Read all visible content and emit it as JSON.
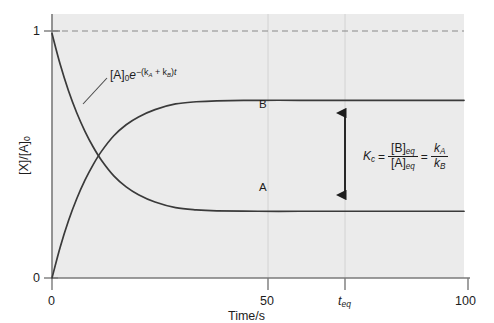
{
  "figure": {
    "title": "",
    "plot_bg_color": "#ebebeb",
    "axis_color": "#6e6e6e",
    "curve_color": "#3a3a3a",
    "text_color": "#1d1d1d"
  },
  "axes": {
    "y": {
      "label": "[X]/[A]",
      "label_sub": "0",
      "ticks": [
        {
          "value": 0,
          "text": "0"
        },
        {
          "value": 1,
          "text": "1"
        }
      ],
      "range": [
        0,
        1.08
      ]
    },
    "x": {
      "label": "Time/s",
      "ticks": [
        {
          "value": 0,
          "text": "0",
          "italic": false
        },
        {
          "value": 50,
          "text": "50",
          "italic": false
        },
        {
          "value": 72,
          "text": "t",
          "sub": "eq",
          "italic": true
        },
        {
          "value": 100,
          "text": "100",
          "italic": false
        }
      ],
      "range": [
        0,
        100
      ]
    }
  },
  "annotations": {
    "curve_a_tag": "A",
    "curve_b_tag": "B",
    "decay_formula": {
      "bracket": "[A]",
      "bracket_sub": "0",
      "base": "e",
      "exponent": "−(k",
      "exp_sub_a": "A",
      "exp_mid": " + k",
      "exp_sub_b": "B",
      "exp_close": ")",
      "exp_t": "t"
    },
    "equilibrium_constant": {
      "symbol": "K",
      "symbol_sub": "c",
      "equals": "=",
      "numerator": "[B]",
      "numerator_sub": "eq",
      "denominator": "[A]",
      "denominator_sub": "eq",
      "equals2": "=",
      "numerator2": "k",
      "numerator2_sub": "A",
      "denominator2": "k",
      "denominator2_sub": "B"
    },
    "dashed_line_value": 1,
    "arrow_label": "equilibrium-gap-arrow"
  },
  "chart_data": {
    "type": "line",
    "title": "",
    "xlabel": "Time/s",
    "ylabel": "[X]/[A]0",
    "xlim": [
      0,
      100
    ],
    "ylim": [
      0,
      1.08
    ],
    "grid": false,
    "legend": "inline-curve-labels",
    "x": [
      0,
      2,
      4,
      6,
      8,
      10,
      12,
      15,
      18,
      21,
      25,
      30,
      35,
      40,
      50,
      60,
      70,
      80,
      90,
      100
    ],
    "series": [
      {
        "name": "A",
        "label": "A",
        "description": "[A]/[A]0 decays from 1 to equilibrium value 0.333",
        "values": [
          1.0,
          0.873,
          0.766,
          0.676,
          0.6,
          0.536,
          0.482,
          0.418,
          0.373,
          0.341,
          0.311,
          0.288,
          0.279,
          0.275,
          0.273,
          0.273,
          0.273,
          0.273,
          0.273,
          0.273
        ]
      },
      {
        "name": "B",
        "label": "B",
        "description": "[B]/[A]0 rises from 0 to equilibrium value 0.667",
        "values": [
          0.0,
          0.127,
          0.234,
          0.324,
          0.4,
          0.464,
          0.518,
          0.582,
          0.627,
          0.659,
          0.689,
          0.712,
          0.721,
          0.725,
          0.727,
          0.727,
          0.727,
          0.727,
          0.727,
          0.727
        ]
      }
    ],
    "reference_lines": [
      {
        "type": "horizontal",
        "value": 1,
        "style": "dashed",
        "label": "initial concentration"
      }
    ],
    "vertical_markers": [
      {
        "x": 50,
        "label": "50"
      },
      {
        "x": 72,
        "label": "t_eq"
      }
    ],
    "equilibrium": {
      "t_eq": 72,
      "A_eq": 0.273,
      "B_eq": 0.727,
      "Kc": 2.66
    }
  }
}
